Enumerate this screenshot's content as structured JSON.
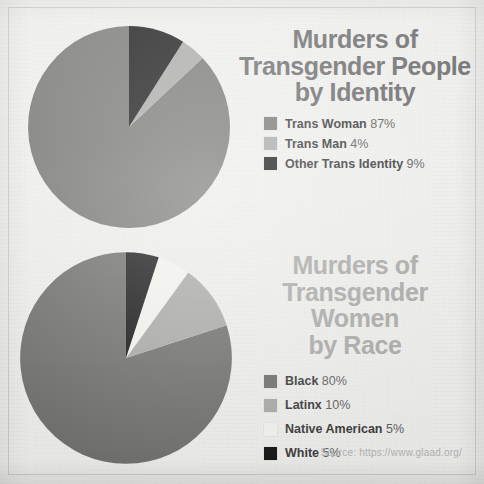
{
  "poster": {
    "background_color": "#eeeeec",
    "source_note": "Source: https://www.glaad.org/"
  },
  "charts": [
    {
      "id": "identity",
      "title_line1": "Murders of",
      "title_line2": "Transgender People",
      "title_line3": "by Identity",
      "title_color": "#6d6d6d",
      "legend": [
        {
          "label": "Trans Woman",
          "percent": "87%",
          "color": "#787876"
        },
        {
          "label": "Trans Man",
          "percent": "4%",
          "color": "#a9a9a7"
        },
        {
          "label": "Other Trans Identity",
          "percent": "9%",
          "color": "#1b1b1b"
        }
      ]
    },
    {
      "id": "race",
      "title_line1": "Murders of",
      "title_line2": "Transgender Women",
      "title_line3": "by Race",
      "title_color": "#a9a9a7",
      "legend": [
        {
          "label": "Black",
          "percent": "80%",
          "color": "#6e6e6c"
        },
        {
          "label": "Latinx",
          "percent": "10%",
          "color": "#a8a8a6"
        },
        {
          "label": "Native American",
          "percent": "5%",
          "color": "#f2f2ee"
        },
        {
          "label": "White",
          "percent": "5%",
          "color": "#141414"
        }
      ]
    }
  ],
  "chart_data": [
    {
      "type": "pie",
      "title": "Murders of Transgender People by Identity",
      "categories": [
        "Trans Woman",
        "Trans Man",
        "Other Trans Identity"
      ],
      "values": [
        87,
        4,
        9
      ],
      "units": "percent",
      "colors": [
        "#787876",
        "#a9a9a7",
        "#1b1b1b"
      ],
      "start_angle_deg": 0,
      "direction": "counterclockwise",
      "legend_position": "right",
      "grid": false,
      "source": "Source: https://www.glaad.org/"
    },
    {
      "type": "pie",
      "title": "Murders of Transgender Women by Race",
      "categories": [
        "Black",
        "Latinx",
        "Native American",
        "White"
      ],
      "values": [
        80,
        10,
        5,
        5
      ],
      "units": "percent",
      "colors": [
        "#6e6e6c",
        "#a8a8a6",
        "#f2f2ee",
        "#141414"
      ],
      "start_angle_deg": 0,
      "direction": "counterclockwise",
      "legend_position": "right",
      "grid": false,
      "source": "Source: https://www.glaad.org/"
    }
  ]
}
